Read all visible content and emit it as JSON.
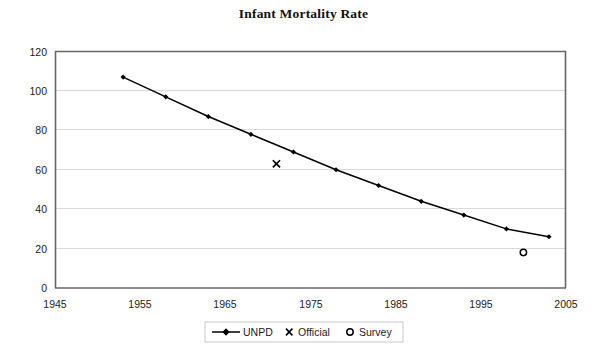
{
  "chart_data": {
    "type": "line",
    "title": "Infant Mortality Rate",
    "xlabel": "",
    "ylabel": "",
    "xlim": [
      1945,
      2005
    ],
    "ylim": [
      0,
      120
    ],
    "xticks": [
      1945,
      1955,
      1965,
      1975,
      1985,
      1995,
      2005
    ],
    "yticks": [
      0,
      20,
      40,
      60,
      80,
      100,
      120
    ],
    "grid": "horizontal",
    "legend_position": "bottom",
    "series": [
      {
        "name": "UNPD",
        "marker": "diamond",
        "line": true,
        "color": "#000000",
        "x": [
          1953,
          1958,
          1963,
          1968,
          1973,
          1978,
          1983,
          1988,
          1993,
          1998,
          2003
        ],
        "values": [
          107,
          97,
          87,
          78,
          69,
          60,
          52,
          44,
          37,
          30,
          26
        ]
      },
      {
        "name": "Official",
        "marker": "x",
        "line": false,
        "color": "#000000",
        "x": [
          1971
        ],
        "values": [
          63
        ]
      },
      {
        "name": "Survey",
        "marker": "circle",
        "line": false,
        "color": "#000000",
        "x": [
          2000
        ],
        "values": [
          18
        ]
      }
    ]
  },
  "legend": {
    "items": [
      {
        "label": "UNPD",
        "marker": "line-diamond"
      },
      {
        "label": "Official",
        "marker": "x"
      },
      {
        "label": "Survey",
        "marker": "circle"
      }
    ]
  },
  "colors": {
    "ink": "#000000",
    "gridline": "#d9d9d9",
    "axis": "#595959",
    "background": "#ffffff"
  }
}
